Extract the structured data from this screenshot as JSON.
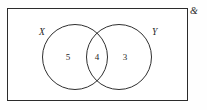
{
  "diagram": {
    "type": "venn-two-set",
    "universe": {
      "symbol": "&",
      "name": "universal-set"
    },
    "sets": [
      {
        "id": "X",
        "label": "X",
        "count_only": "5"
      },
      {
        "id": "Y",
        "label": "Y",
        "count_only": "3"
      }
    ],
    "regions": {
      "x_only": "5",
      "intersection": "4",
      "y_only": "3"
    },
    "colors": {
      "border": "#2b2b2b",
      "circle_stroke": "#2f2f2f",
      "text": "#262626",
      "background": "#ffffff"
    }
  },
  "chart_data": {
    "type": "venn",
    "title": "",
    "categories": [
      "X only",
      "X ∩ Y",
      "Y only"
    ],
    "values": [
      5,
      4,
      3
    ],
    "set_labels": [
      "X",
      "Y"
    ],
    "universe_label": "&",
    "totals": {
      "X": 9,
      "Y": 7,
      "universe_shown": 12
    },
    "grid": false,
    "legend": "none"
  }
}
